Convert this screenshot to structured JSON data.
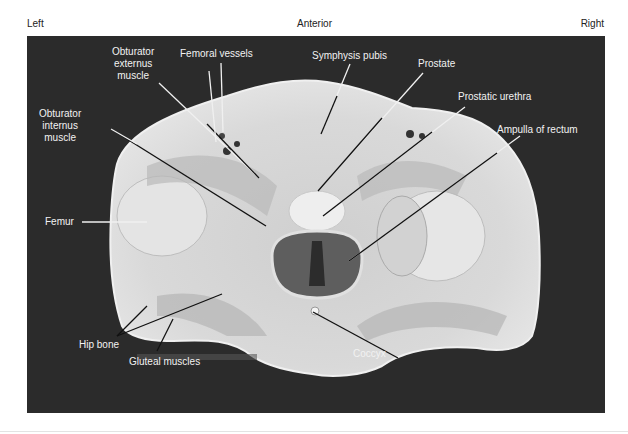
{
  "orientation": {
    "left": "Left",
    "anterior": "Anterior",
    "right": "Right"
  },
  "figure": {
    "background_color": "#2b2b2b",
    "tissue_color": "#d8d8d8",
    "leader_line_color_on_dark": "#e8e8e8",
    "leader_line_color_on_tissue": "#111111"
  },
  "labels": {
    "obturator_externus": [
      "Obturator",
      "externus",
      "muscle"
    ],
    "obturator_internus": [
      "Obturator",
      "internus",
      "muscle"
    ],
    "femoral_vessels": "Femoral vessels",
    "symphysis_pubis": "Symphysis pubis",
    "prostate": "Prostate",
    "prostatic_urethra": "Prostatic urethra",
    "ampulla_of_rectum": "Ampulla of rectum",
    "femur": "Femur",
    "hip_bone": "Hip bone",
    "gluteal_muscles": "Gluteal muscles",
    "coccyx": "Coccyx"
  }
}
